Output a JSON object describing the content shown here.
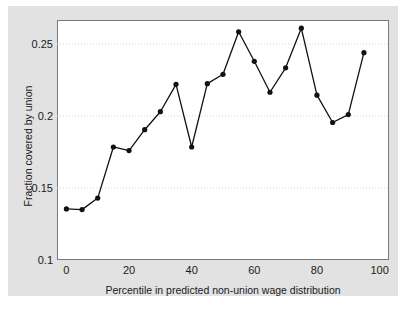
{
  "chart_data": {
    "type": "line",
    "title": "",
    "xlabel": "Percentile in predicted non-union wage distribution",
    "ylabel": "Fraction covered by union",
    "xlim": [
      -3,
      103
    ],
    "ylim": [
      0.1,
      0.2667
    ],
    "grid": true,
    "grid_axis": "y",
    "legend": "none",
    "xticks": [
      0,
      20,
      40,
      60,
      80,
      100
    ],
    "xtick_labels": [
      "0",
      "20",
      "40",
      "60",
      "80",
      "100"
    ],
    "yticks": [
      0.1,
      0.15,
      0.2,
      0.25
    ],
    "ytick_labels": [
      "0.1",
      "0.15",
      "0.2",
      "0.25"
    ],
    "marker": "filled-circle",
    "marker_color": "#111111",
    "line_color": "#111111",
    "x": [
      0,
      5,
      10,
      15,
      20,
      25,
      30,
      35,
      40,
      45,
      50,
      55,
      60,
      65,
      70,
      75,
      80,
      85,
      90,
      95
    ],
    "values": [
      0.1355,
      0.135,
      0.143,
      0.1785,
      0.176,
      0.1905,
      0.203,
      0.222,
      0.1785,
      0.2225,
      0.229,
      0.2585,
      0.238,
      0.2165,
      0.2335,
      0.261,
      0.2145,
      0.1955,
      0.201,
      0.244
    ],
    "series": [
      {
        "name": "Fraction covered by union",
        "values": [
          0.1355,
          0.135,
          0.143,
          0.1785,
          0.176,
          0.1905,
          0.203,
          0.222,
          0.1785,
          0.2225,
          0.229,
          0.2585,
          0.238,
          0.2165,
          0.2335,
          0.261,
          0.2145,
          0.1955,
          0.201,
          0.244
        ]
      }
    ],
    "colors": {
      "figure_background": "#e2e2e2",
      "plot_background": "#ffffff",
      "frame": "#7a7a7a",
      "gridline": "#d8d8d8",
      "text": "#1a1a1a"
    }
  }
}
